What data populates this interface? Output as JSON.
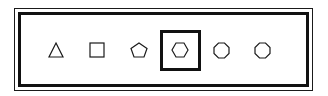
{
  "panel": {
    "frame_color": "#111111",
    "background": "#ffffff",
    "selected_index": 3
  },
  "shapes": [
    {
      "name": "triangle",
      "sides": 3,
      "selected": false
    },
    {
      "name": "square",
      "sides": 4,
      "selected": false
    },
    {
      "name": "pentagon",
      "sides": 5,
      "selected": false
    },
    {
      "name": "hexagon",
      "sides": 6,
      "selected": true
    },
    {
      "name": "octagon",
      "sides": 8,
      "selected": false
    },
    {
      "name": "octagon",
      "sides": 8,
      "selected": false
    }
  ]
}
